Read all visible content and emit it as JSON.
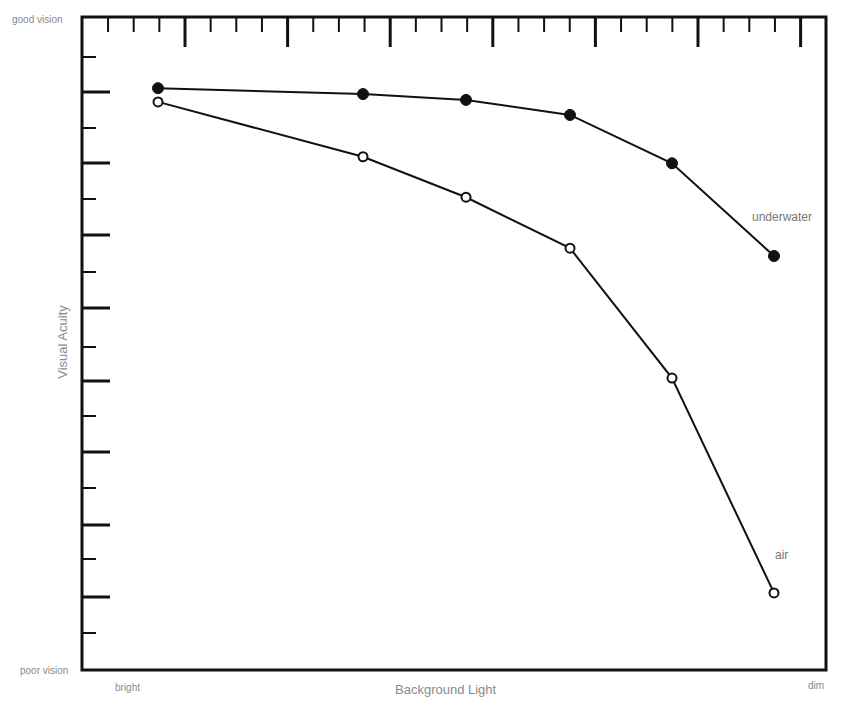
{
  "chart_data": {
    "type": "line",
    "title": "",
    "xlabel": "Background Light",
    "ylabel": "Visual Acuity",
    "x_axis": {
      "start_label": "bright",
      "end_label": "dim",
      "tick_labels": []
    },
    "y_axis": {
      "top_label": "good vision",
      "bottom_label": "poor vision",
      "tick_labels": []
    },
    "x": [
      0,
      2,
      3,
      4,
      5,
      6
    ],
    "series": [
      {
        "name": "underwater",
        "marker": "filled-circle",
        "values": [
          89.1,
          88.2,
          87.3,
          85.0,
          77.6,
          63.4
        ]
      },
      {
        "name": "air",
        "marker": "open-circle",
        "values": [
          87.0,
          78.6,
          72.4,
          64.6,
          44.7,
          11.8
        ]
      }
    ],
    "ylim": [
      0,
      100
    ],
    "xlim": [
      -0.5,
      6.5
    ],
    "grid": false,
    "legend": "inline labels near line ends",
    "units_note": "relative scale (0 = poor vision, 100 = good vision); no numeric tick labels shown"
  },
  "labels": {
    "good_vision": "good vision",
    "poor_vision": "poor vision",
    "bright": "bright",
    "dim": "dim",
    "xlabel": "Background Light",
    "ylabel": "Visual Acuity",
    "underwater": "underwater",
    "air": "air"
  },
  "layout": {
    "plot": {
      "left": 82,
      "top": 17,
      "right": 826,
      "bottom": 670
    },
    "point_x_px": [
      158,
      363,
      466,
      570,
      672,
      774
    ],
    "colors": {
      "line": "#111111",
      "label": "#8a8a8a",
      "background": "#ffffff"
    }
  }
}
